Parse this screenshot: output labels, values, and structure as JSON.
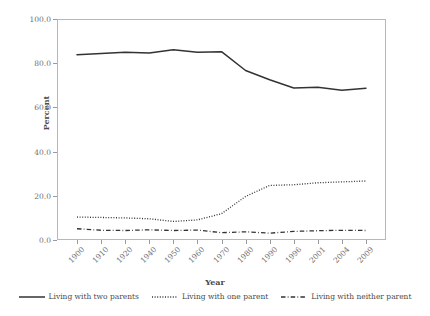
{
  "chart_data": {
    "type": "line",
    "title": "",
    "xlabel": "Year",
    "ylabel": "Percent",
    "categories": [
      "1900",
      "1910",
      "1920",
      "1940",
      "1950",
      "1960",
      "1970",
      "1980",
      "1990",
      "1996",
      "2001",
      "2004",
      "2009"
    ],
    "ylim": [
      0,
      100
    ],
    "yticks": [
      "0.0",
      "20.0",
      "40.0",
      "60.0",
      "80.0",
      "100.0"
    ],
    "ytick_values": [
      0,
      20,
      40,
      60,
      80,
      100
    ],
    "grid": false,
    "legend_position": "bottom",
    "series": [
      {
        "name": "Living with two parents",
        "style": "solid",
        "color": "#333333",
        "values": [
          83.8,
          84.4,
          85.0,
          84.6,
          86.1,
          85.0,
          85.2,
          76.7,
          72.5,
          68.8,
          69.1,
          67.8,
          68.7
        ]
      },
      {
        "name": "Living with one parent",
        "style": "dotted",
        "color": "#333333",
        "values": [
          10.4,
          10.2,
          10.0,
          9.6,
          8.4,
          9.1,
          11.9,
          19.7,
          24.7,
          25.0,
          25.9,
          26.3,
          26.7
        ]
      },
      {
        "name": "Living with neither parent",
        "style": "dashdot",
        "color": "#333333",
        "values": [
          5.1,
          4.4,
          4.3,
          4.6,
          4.3,
          4.5,
          3.3,
          3.7,
          3.1,
          3.9,
          4.2,
          4.4,
          4.3
        ]
      }
    ]
  },
  "axes": {
    "y_title": "Percent",
    "x_title": "Year"
  },
  "legend": {
    "items": [
      {
        "label": "Living with two parents",
        "style": "solid"
      },
      {
        "label": "Living with one parent",
        "style": "dotted"
      },
      {
        "label": "Living with neither parent",
        "style": "dashdot"
      }
    ]
  }
}
